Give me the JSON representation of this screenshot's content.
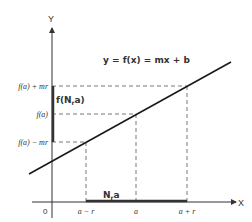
{
  "diagram": {
    "axes": {
      "x_label": "X",
      "y_label": "Y",
      "origin_label": "0"
    },
    "equation": "y = f(x) = mx + b",
    "y_ticks": [
      {
        "label": "f(a) + mr"
      },
      {
        "label": "f(a)"
      },
      {
        "label": "f(a) − mr"
      }
    ],
    "x_ticks": [
      {
        "label": "a − r"
      },
      {
        "label": "a"
      },
      {
        "label": "a + r"
      }
    ],
    "interval_labels": {
      "y_interval": "f(N",
      "y_interval_sub": "r",
      "y_interval_tail": "a)",
      "x_interval": "N",
      "x_interval_sub": "r",
      "x_interval_tail": "a"
    },
    "colors": {
      "line": "#1a1a1a",
      "axis": "#333333",
      "dashed": "#555555",
      "highlight": "#333333"
    }
  }
}
